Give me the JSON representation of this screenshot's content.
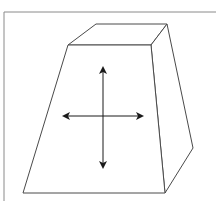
{
  "diagram": {
    "colors": {
      "background": "#ffffff",
      "frame": "#8a8a8a",
      "edges": "#4a4a4a",
      "arrows": "#1a1a1a"
    },
    "frame": {
      "top_y": 12,
      "left_x": 4
    },
    "shape": {
      "front_face": [
        [
          68,
          45
        ],
        [
          151,
          45
        ],
        [
          165,
          193
        ],
        [
          23,
          193
        ]
      ],
      "top_face": [
        [
          68,
          45
        ],
        [
          96,
          24
        ],
        [
          167,
          24
        ],
        [
          151,
          45
        ]
      ],
      "right_face": [
        [
          151,
          45
        ],
        [
          167,
          24
        ],
        [
          193,
          148
        ],
        [
          165,
          193
        ]
      ]
    },
    "arrows": {
      "center": [
        103,
        116
      ],
      "vertical": {
        "x": 103,
        "y1": 68,
        "y2": 167
      },
      "horizontal": {
        "y": 116,
        "x1": 64,
        "x2": 142
      },
      "icon": "four-way-move-arrows"
    }
  }
}
